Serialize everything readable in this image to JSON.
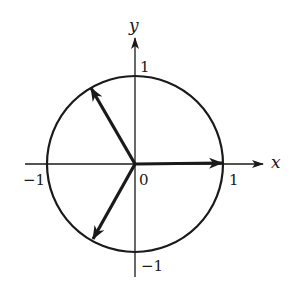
{
  "diagram": {
    "title": "",
    "type": "unit-circle-vectors",
    "axes": {
      "x_label": "x",
      "y_label": "y",
      "tick_labels": {
        "x_pos": "1",
        "x_neg": "−1",
        "y_pos": "1",
        "y_neg": "−1",
        "origin": "0"
      }
    },
    "circle": {
      "center": [
        0,
        0
      ],
      "radius": 1
    },
    "vectors": [
      {
        "name": "vector-0deg",
        "angle_deg": 0,
        "tip": [
          1,
          0
        ]
      },
      {
        "name": "vector-120deg",
        "angle_deg": 120,
        "tip": [
          -0.5,
          0.866
        ]
      },
      {
        "name": "vector-240deg",
        "angle_deg": 240,
        "tip": [
          -0.5,
          -0.866
        ]
      }
    ],
    "colors": {
      "stroke": "#1a1a1a",
      "background": "#ffffff"
    }
  }
}
